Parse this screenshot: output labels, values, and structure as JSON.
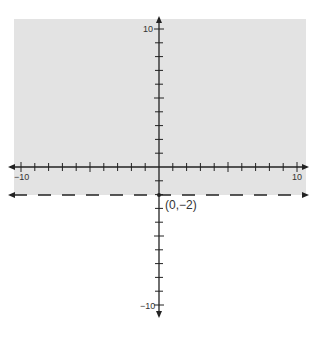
{
  "chart_data": {
    "type": "inequality-graph",
    "title": "",
    "inequality": "y > -2",
    "boundary": {
      "equation": "y = -2",
      "style": "dashed"
    },
    "shaded_region": "above boundary",
    "point_label": "(0,−2)",
    "point": [
      0,
      -2
    ],
    "xlim": [
      -10,
      10
    ],
    "ylim": [
      -10,
      10
    ],
    "tick_step": 1,
    "tick_labels": {
      "x_min": "−10",
      "x_max": "10",
      "y_max": "10",
      "y_min": "−10"
    },
    "grid": false
  },
  "colors": {
    "shade": "#e3e3e3",
    "axis": "#222222",
    "boundary": "#222222"
  }
}
